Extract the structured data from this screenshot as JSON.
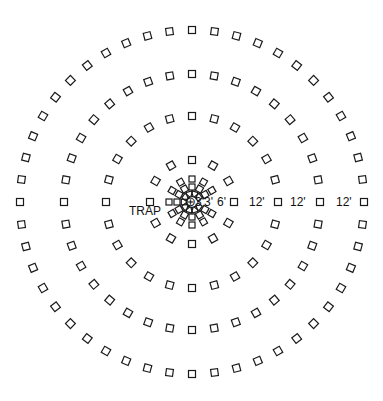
{
  "diagram": {
    "center": {
      "x": 192,
      "y": 202
    },
    "stroke_color": "#1a1a1a",
    "background": "#ffffff",
    "trap_symbol": "⊕",
    "rings": [
      {
        "radius": 8,
        "count": 10,
        "size": 5.5,
        "spacing_label": "3'"
      },
      {
        "radius": 15,
        "count": 12,
        "size": 6,
        "spacing_label": "3'"
      },
      {
        "radius": 23,
        "count": 12,
        "size": 6,
        "spacing_label": "6'"
      },
      {
        "radius": 42,
        "count": 12,
        "size": 7,
        "spacing_label": "6'"
      },
      {
        "radius": 86,
        "count": 24,
        "size": 7,
        "spacing_label": "12'"
      },
      {
        "radius": 128,
        "count": 36,
        "size": 7,
        "spacing_label": "12'"
      },
      {
        "radius": 172,
        "count": 48,
        "size": 7,
        "spacing_label": "12'"
      }
    ],
    "labels": {
      "trap": "TRAP",
      "d1": "3'",
      "d2": "3'",
      "d3": "6'",
      "d4": "12'",
      "d5": "12'",
      "d6": "12'"
    }
  }
}
